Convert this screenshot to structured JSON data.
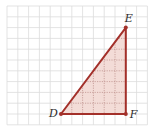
{
  "diagram": {
    "type": "right-triangle-on-grid",
    "grid": {
      "origin_x": 7,
      "origin_y": 6,
      "cell": 10.8,
      "cols": 13,
      "rows": 11,
      "line_color": "#dcdcdc"
    },
    "triangle": {
      "vertices": [
        {
          "name": "D",
          "label": "D",
          "col": 5,
          "row": 10
        },
        {
          "name": "E",
          "label": "E",
          "col": 11,
          "row": 2
        },
        {
          "name": "F",
          "label": "F",
          "col": 11,
          "row": 10
        }
      ],
      "right_angle_at": "F",
      "leg_DF_units": 6,
      "leg_EF_units": 8,
      "stroke_color": "#a3302a",
      "fill_color": "#f3dcd7",
      "inner_grid_color": "#b98a85"
    },
    "labels": {
      "D": "D",
      "E": "E",
      "F": "F"
    }
  }
}
